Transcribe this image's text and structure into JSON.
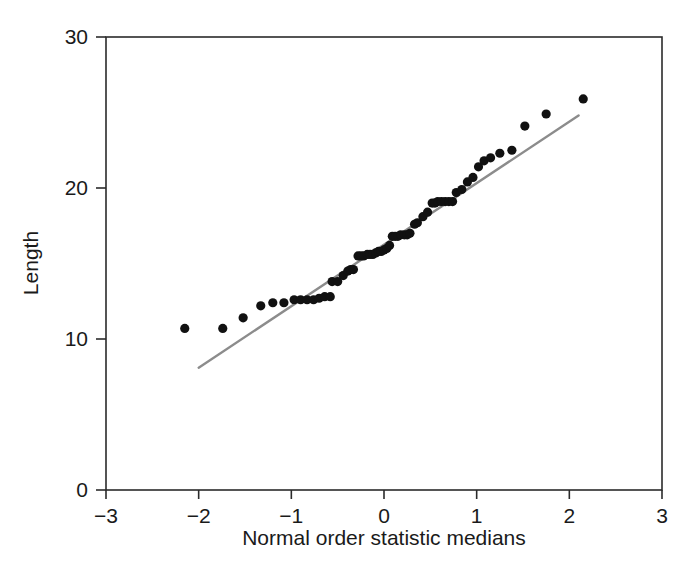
{
  "figure": {
    "background_color": "#ffffff",
    "frame_color": "#2b2b2b",
    "marker_color": "#111111",
    "line_color": "#8c8c8c"
  },
  "chart_data": {
    "type": "scatter",
    "title": "",
    "subtitle": "",
    "xlabel": "Normal order statistic medians",
    "ylabel": "Length",
    "xlim": [
      -3,
      3
    ],
    "ylim": [
      0,
      30
    ],
    "xticks": [
      -3,
      -2,
      -1,
      0,
      1,
      2,
      3
    ],
    "xtick_labels": [
      "−3",
      "−2",
      "−1",
      "0",
      "1",
      "2",
      "3"
    ],
    "yticks": [
      0,
      10,
      20,
      30
    ],
    "ytick_labels": [
      "0",
      "10",
      "20",
      "30"
    ],
    "grid": false,
    "legend": null,
    "series": [
      {
        "name": "Length vs normal order statistic medians",
        "marker": "filled-circle",
        "color": "#111111",
        "x": [
          -2.15,
          -1.74,
          -1.52,
          -1.33,
          -1.2,
          -1.08,
          -0.97,
          -0.9,
          -0.83,
          -0.76,
          -0.7,
          -0.64,
          -0.58,
          -0.56,
          -0.5,
          -0.44,
          -0.39,
          -0.36,
          -0.33,
          -0.28,
          -0.25,
          -0.22,
          -0.18,
          -0.15,
          -0.12,
          -0.09,
          -0.06,
          -0.03,
          0.0,
          0.03,
          0.06,
          0.09,
          0.12,
          0.15,
          0.18,
          0.22,
          0.25,
          0.28,
          0.33,
          0.36,
          0.42,
          0.47,
          0.52,
          0.55,
          0.58,
          0.62,
          0.66,
          0.7,
          0.74,
          0.78,
          0.84,
          0.9,
          0.96,
          1.02,
          1.08,
          1.15,
          1.25,
          1.38,
          1.52,
          1.75,
          2.15
        ],
        "y": [
          10.7,
          10.7,
          11.4,
          12.2,
          12.4,
          12.4,
          12.6,
          12.6,
          12.6,
          12.6,
          12.7,
          12.8,
          12.8,
          13.8,
          13.8,
          14.2,
          14.5,
          14.6,
          14.6,
          15.5,
          15.5,
          15.5,
          15.6,
          15.6,
          15.6,
          15.7,
          15.8,
          15.8,
          15.9,
          16.0,
          16.2,
          16.8,
          16.8,
          16.8,
          16.9,
          16.9,
          16.9,
          17.0,
          17.6,
          17.7,
          18.1,
          18.4,
          19.0,
          19.0,
          19.1,
          19.1,
          19.1,
          19.1,
          19.1,
          19.7,
          19.9,
          20.4,
          20.7,
          21.4,
          21.8,
          22.0,
          22.3,
          22.5,
          24.1,
          24.9,
          25.9
        ],
        "count": 61
      }
    ],
    "reference_line": {
      "name": "reference line",
      "color": "#8c8c8c",
      "x_start": -2.0,
      "y_start": 8.1,
      "x_end": 2.1,
      "y_end": 24.8
    }
  }
}
